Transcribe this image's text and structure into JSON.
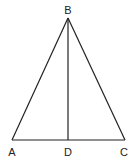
{
  "diagram": {
    "type": "geometry",
    "points": {
      "A": {
        "label": "A",
        "x": 12,
        "y": 140
      },
      "B": {
        "label": "B",
        "x": 68,
        "y": 18
      },
      "C": {
        "label": "C",
        "x": 125,
        "y": 140
      },
      "D": {
        "label": "D",
        "x": 68,
        "y": 140
      }
    },
    "segments": [
      {
        "from": "A",
        "to": "B"
      },
      {
        "from": "B",
        "to": "C"
      },
      {
        "from": "A",
        "to": "C"
      },
      {
        "from": "B",
        "to": "D"
      }
    ],
    "line_color": "#222222"
  }
}
